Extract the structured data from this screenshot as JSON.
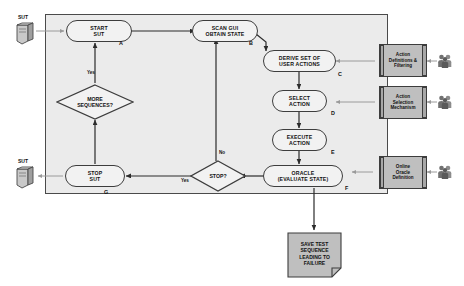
{
  "diagram": {
    "container": {
      "label": ""
    },
    "nodes": [
      {
        "id": "start_sut",
        "lines": [
          "START",
          "SUT"
        ],
        "tag": "A",
        "shape": "stadium"
      },
      {
        "id": "scan_gui",
        "lines": [
          "SCAN GUI",
          "OBTAIN STATE"
        ],
        "tag": "B",
        "shape": "stadium"
      },
      {
        "id": "derive",
        "lines": [
          "DERIVE SET OF",
          "USER ACTIONS"
        ],
        "tag": "C",
        "shape": "stadium"
      },
      {
        "id": "select",
        "lines": [
          "SELECT",
          "ACTION"
        ],
        "tag": "D",
        "shape": "stadium"
      },
      {
        "id": "execute",
        "lines": [
          "EXECUTE",
          "ACTION"
        ],
        "tag": "E",
        "shape": "stadium"
      },
      {
        "id": "oracle",
        "lines": [
          "ORACLE",
          "(EVALUATE STATE)"
        ],
        "tag": "F",
        "shape": "stadium"
      },
      {
        "id": "stop_sut",
        "lines": [
          "STOP",
          "SUT"
        ],
        "tag": "G",
        "shape": "stadium"
      }
    ],
    "decisions": [
      {
        "id": "more_sequences",
        "lines": [
          "MORE",
          "SEQUENCES?"
        ],
        "shape": "diamond"
      },
      {
        "id": "stop_q",
        "lines": [
          "STOP?"
        ],
        "shape": "diamond"
      }
    ],
    "components": [
      {
        "id": "action_definitions",
        "lines": [
          "Action",
          "Definitions &",
          "Filtering"
        ]
      },
      {
        "id": "action_selection",
        "lines": [
          "Action",
          "Selection",
          "Mechanism"
        ]
      },
      {
        "id": "online_oracle",
        "lines": [
          "Online",
          "Oracle",
          "Definition"
        ]
      }
    ],
    "document": {
      "id": "save_test_sequence",
      "lines": [
        "SAVE TEST",
        "SEQUENCE",
        "LEADING TO",
        "FAILURE"
      ]
    },
    "sut_icons": [
      {
        "id": "sut_top",
        "label": "SUT"
      },
      {
        "id": "sut_bottom",
        "label": "SUT"
      }
    ],
    "people_icons": [
      {
        "id": "people_action_definitions",
        "name": "people-icon"
      },
      {
        "id": "people_action_selection",
        "name": "people-icon"
      },
      {
        "id": "people_online_oracle",
        "name": "people-icon"
      }
    ],
    "edge_labels": [
      {
        "id": "yes_more_sequences",
        "text": "Yes"
      },
      {
        "id": "no_stop",
        "text": "No"
      },
      {
        "id": "yes_stop",
        "text": "Yes"
      }
    ],
    "colors": {
      "container_fill": "#ebebeb",
      "node_fill": "#f2f2f2",
      "component_fill": "#bfbfbf",
      "document_fill": "#bfbfbf",
      "stroke": "#3d3d3d",
      "arrow": "#2b2b2b",
      "light_arrow": "#9a9a9a",
      "page_background": "#ffffff"
    }
  }
}
